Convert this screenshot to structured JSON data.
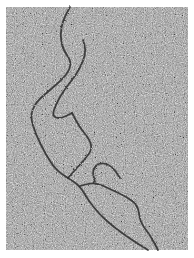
{
  "image": {
    "kind": "electron-micrograph",
    "description": "Grainy gray micrograph with dark branching filament strands",
    "background_color": "#ffffff",
    "field": {
      "x": 6,
      "y": 7,
      "width": 182,
      "height": 243,
      "base_gray": "#9a9a9a"
    },
    "filament_color": "#2a2a2a",
    "strands": [
      {
        "id": "strand-a",
        "points": [
          [
            70,
            7
          ],
          [
            63,
            20
          ],
          [
            60,
            35
          ],
          [
            63,
            50
          ],
          [
            72,
            62
          ],
          [
            67,
            75
          ],
          [
            50,
            90
          ],
          [
            36,
            102
          ],
          [
            30,
            116
          ],
          [
            36,
            135
          ],
          [
            46,
            155
          ],
          [
            56,
            170
          ],
          [
            68,
            178
          ],
          [
            80,
            186
          ],
          [
            88,
            200
          ],
          [
            100,
            215
          ],
          [
            115,
            228
          ],
          [
            132,
            240
          ],
          [
            148,
            250
          ]
        ]
      },
      {
        "id": "strand-b",
        "points": [
          [
            83,
            40
          ],
          [
            86,
            50
          ],
          [
            83,
            62
          ],
          [
            76,
            75
          ],
          [
            64,
            90
          ],
          [
            56,
            104
          ],
          [
            52,
            116
          ],
          [
            60,
            119
          ],
          [
            72,
            113
          ]
        ]
      },
      {
        "id": "strand-c",
        "points": [
          [
            72,
            113
          ],
          [
            80,
            128
          ],
          [
            90,
            140
          ],
          [
            92,
            150
          ],
          [
            84,
            160
          ],
          [
            75,
            170
          ],
          [
            68,
            178
          ]
        ]
      },
      {
        "id": "strand-d",
        "points": [
          [
            80,
            186
          ],
          [
            95,
            182
          ],
          [
            112,
            190
          ],
          [
            125,
            196
          ],
          [
            138,
            205
          ],
          [
            140,
            222
          ],
          [
            150,
            235
          ],
          [
            158,
            250
          ]
        ]
      },
      {
        "id": "strand-e",
        "points": [
          [
            95,
            182
          ],
          [
            92,
            170
          ],
          [
            100,
            162
          ],
          [
            112,
            166
          ],
          [
            120,
            178
          ]
        ]
      }
    ]
  }
}
